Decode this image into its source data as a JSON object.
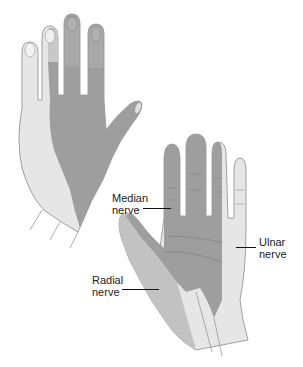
{
  "figure": {
    "title": "",
    "views": [
      "dorsal-hand",
      "palmar-hand"
    ],
    "colors": {
      "ulnar": "#e6e6e6",
      "median": "#9e9e9e",
      "radial": "#c2c2c2",
      "outline": "#8a8a8a",
      "leader": "#111111"
    }
  },
  "labels": {
    "median": {
      "line1": "Median",
      "line2": "nerve"
    },
    "ulnar": {
      "line1": "Ulnar",
      "line2": "nerve"
    },
    "radial": {
      "line1": "Radial",
      "line2": "nerve"
    }
  }
}
